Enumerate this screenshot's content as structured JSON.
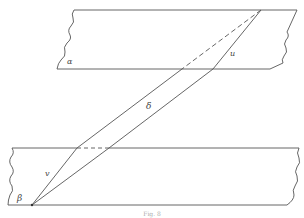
{
  "diagram": {
    "planes": [
      {
        "id": "alpha",
        "label": "α"
      },
      {
        "id": "beta",
        "label": "β"
      }
    ],
    "segments": [
      {
        "id": "u",
        "label": "u"
      },
      {
        "id": "delta",
        "label": "δ"
      },
      {
        "id": "v",
        "label": "v"
      }
    ],
    "caption": "Fig. 8",
    "colors": {
      "stroke": "#555555",
      "background": "#ffffff"
    }
  }
}
